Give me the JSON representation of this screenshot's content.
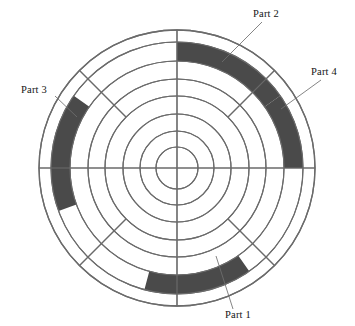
{
  "figure": {
    "background_color": "#ffffff",
    "line_color": "#6b6b6b",
    "band_color": "#4a4a4a",
    "label_color": "#141414",
    "center": {
      "x": 177,
      "y": 168
    },
    "ring_radii": [
      138,
      126,
      107,
      89,
      72,
      54,
      37,
      21
    ],
    "ring_count": 8,
    "spokes": {
      "cardinal_angles_deg": [
        0,
        90,
        180,
        270
      ],
      "diagonal_angles_deg": [
        45,
        135,
        225,
        315
      ],
      "diagonal_inner_radius": 72,
      "diagonal_outer_radius": 138
    },
    "highlight_ring": {
      "inner_radius": 107,
      "outer_radius": 126
    }
  },
  "labels": [
    {
      "id": "part-1",
      "text": "Part 1",
      "text_x": 238,
      "text_y": 318,
      "anchor": "middle",
      "leader": {
        "x1": 233,
        "y1": 309,
        "x2": 216,
        "y2": 256
      }
    },
    {
      "id": "part-2",
      "text": "Part 2",
      "text_x": 266,
      "text_y": 17,
      "anchor": "middle",
      "leader": {
        "x1": 262,
        "y1": 22,
        "x2": 222,
        "y2": 62
      }
    },
    {
      "id": "part-3",
      "text": "Part 3",
      "text_x": 34,
      "text_y": 93,
      "anchor": "middle",
      "leader": {
        "x1": 55,
        "y1": 96,
        "x2": 77,
        "y2": 117
      }
    },
    {
      "id": "part-4",
      "text": "Part 4",
      "text_x": 324,
      "text_y": 75,
      "anchor": "middle",
      "leader": {
        "x1": 321,
        "y1": 80,
        "x2": 281,
        "y2": 109
      }
    }
  ],
  "chart_data": {
    "type": "pie",
    "xlabel": "",
    "ylabel": "",
    "legend_position": "callout-labels",
    "grid": true,
    "categories": [
      "Part 1",
      "Part 2",
      "Part 3",
      "Part 4"
    ],
    "values": [
      50,
      55,
      55,
      35
    ],
    "series": [
      {
        "name": "Highlighted arc segments (degrees of sweep, measured clockwise from 12 o'clock)",
        "values": [
          50,
          55,
          55,
          35
        ]
      }
    ],
    "segments": [
      {
        "name": "Part 2",
        "start_angle_deg": 0,
        "end_angle_deg": 55,
        "sweep_deg": 55,
        "inner_radius": 107,
        "outer_radius": 126,
        "color": "#4a4a4a"
      },
      {
        "name": "Part 4",
        "start_angle_deg": 55,
        "end_angle_deg": 90,
        "sweep_deg": 35,
        "inner_radius": 107,
        "outer_radius": 126,
        "color": "#4a4a4a"
      },
      {
        "name": "Part 1",
        "start_angle_deg": 145,
        "end_angle_deg": 195,
        "sweep_deg": 50,
        "inner_radius": 107,
        "outer_radius": 126,
        "color": "#4a4a4a"
      },
      {
        "name": "Part 3",
        "start_angle_deg": 250,
        "end_angle_deg": 305,
        "sweep_deg": 55,
        "inner_radius": 107,
        "outer_radius": 126,
        "color": "#4a4a4a"
      }
    ],
    "ylim": [
      0,
      138
    ]
  }
}
